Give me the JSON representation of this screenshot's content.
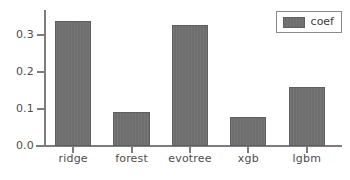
{
  "chart_data": {
    "type": "bar",
    "title": "",
    "xlabel": "",
    "ylabel": "",
    "categories": [
      "ridge",
      "forest",
      "evotree",
      "xgb",
      "lgbm"
    ],
    "values": [
      0.338,
      0.092,
      0.327,
      0.077,
      0.159
    ],
    "series": [
      {
        "name": "coef",
        "values": [
          0.338,
          0.092,
          0.327,
          0.077,
          0.159
        ]
      }
    ],
    "ylim": [
      0.0,
      0.3664
    ],
    "xlim": [
      0,
      5
    ],
    "yticks": [
      0.0,
      0.1,
      0.2,
      0.3
    ],
    "ytick_labels": [
      "0.0",
      "0.1",
      "0.2",
      "0.3"
    ],
    "xtick_labels": [
      "ridge",
      "forest",
      "evotree",
      "xgb",
      "lgbm"
    ],
    "grid": false,
    "legend": {
      "entries": [
        "coef"
      ],
      "position": "upper right",
      "visible": true
    },
    "colors": {
      "bar_fill": "#6e6e6e",
      "bar_edge": "#5f5f5f",
      "axis": "#7d7d7d",
      "tick_text": "#4d4d4d",
      "background": "#ffffff",
      "legend_border": "#8a8a8a"
    }
  }
}
